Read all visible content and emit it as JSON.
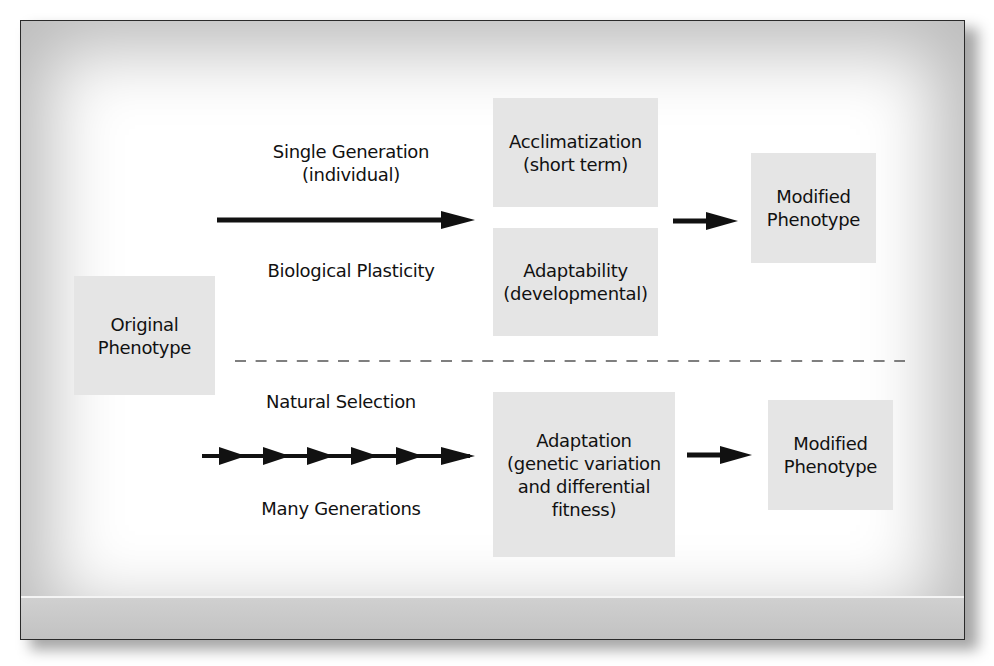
{
  "diagram": {
    "colors": {
      "box_fill": "#e5e5e5",
      "arrow": "#111111",
      "text": "#111111",
      "frame_border": "#2a2a2a",
      "vignette": "#bdbdbd",
      "dashed_line": "#555555"
    },
    "origin": {
      "lines": [
        "Original",
        "Phenotype"
      ]
    },
    "top_pathway": {
      "label_above": [
        "Single Generation",
        "(individual)"
      ],
      "label_below": "Biological Plasticity",
      "arrow_icon": "long-right-arrow",
      "outcomes": [
        {
          "lines": [
            "Acclimatization",
            "(short term)"
          ]
        },
        {
          "lines": [
            "Adaptability",
            "(developmental)"
          ]
        }
      ],
      "result": {
        "lines": [
          "Modified",
          "Phenotype"
        ]
      },
      "result_arrow_icon": "right-arrow"
    },
    "divider": {
      "style": "dashed"
    },
    "bottom_pathway": {
      "label_above": "Natural Selection",
      "label_below": "Many Generations",
      "arrow_icon": "chained-right-arrows",
      "chain_count": 6,
      "outcome": {
        "lines": [
          "Adaptation",
          "(genetic variation",
          "and differential",
          "fitness)"
        ]
      },
      "result": {
        "lines": [
          "Modified",
          "Phenotype"
        ]
      },
      "result_arrow_icon": "right-arrow"
    }
  }
}
